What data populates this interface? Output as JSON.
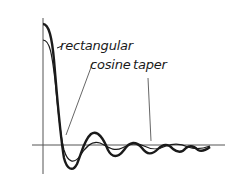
{
  "figure": {
    "labels": {
      "rectangular": "rectangular",
      "cosine_taper": "cosine",
      "taper": "taper"
    },
    "colors": {
      "axis": "#555555",
      "curve": "#1a1a1a",
      "background": "#ffffff"
    },
    "curves": [
      {
        "name": "rectangular",
        "style": "thick"
      },
      {
        "name": "cosine taper",
        "style": "thin"
      }
    ]
  }
}
